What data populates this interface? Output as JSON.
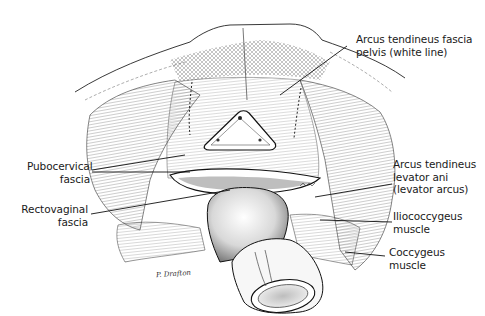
{
  "figure": {
    "labels": [
      {
        "id": "arcus-tendineus-fascia-pelvis",
        "lines": [
          "Arcus tendineus fascia",
          "pelvis (white line)"
        ]
      },
      {
        "id": "pubocervical-fascia",
        "lines": [
          "Pubocervical",
          "fascia"
        ]
      },
      {
        "id": "rectovaginal-fascia",
        "lines": [
          "Rectovaginal",
          "fascia"
        ]
      },
      {
        "id": "arcus-tendineus-levator-ani",
        "lines": [
          "Arcus tendineus",
          "levator ani",
          "(levator arcus)"
        ]
      },
      {
        "id": "iliococcygeus-muscle",
        "lines": [
          "Iliococcygeus",
          "muscle"
        ]
      },
      {
        "id": "coccygeus-muscle",
        "lines": [
          "Coccygeus",
          "muscle"
        ]
      }
    ],
    "signature": "P. Drafton",
    "colors": {
      "ink": "#1a1a1a",
      "background": "#ffffff",
      "shade": "#cfcfcf"
    }
  }
}
